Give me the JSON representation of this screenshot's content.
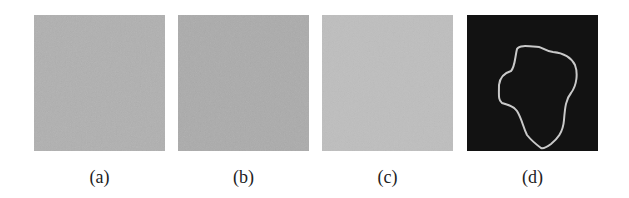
{
  "figure": {
    "panels": [
      {
        "id": "a",
        "label": "(a)",
        "description": "noisy uniform gray image",
        "color": "#b0b0b0",
        "left": 34
      },
      {
        "id": "b",
        "label": "(b)",
        "description": "noisy uniform gray image",
        "color": "#aaaaaa",
        "left": 178
      },
      {
        "id": "c",
        "label": "(c)",
        "description": "noisy uniform light gray image",
        "color": "#bdbdbd",
        "left": 322
      },
      {
        "id": "d",
        "label": "(d)",
        "description": "black background with light gray closed contour",
        "color": "#121212",
        "contour_color": "#c9c9c9",
        "left": 467
      }
    ]
  }
}
